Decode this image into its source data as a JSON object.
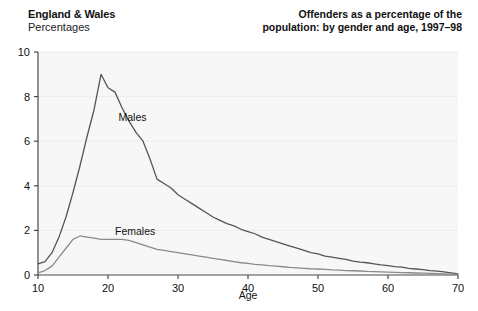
{
  "header": {
    "region": "England & Wales",
    "units": "Percentages",
    "title_line1": "Offenders as a percentage of the",
    "title_line2": "population: by gender and age, 1997–98"
  },
  "colors": {
    "plot_background": "#f7f7f7",
    "gridline": "#ececec",
    "axis": "#4a4a4a",
    "males_line": "#555555",
    "females_line": "#8a8a8a",
    "text": "#111111"
  },
  "chart_data": {
    "type": "line",
    "title": "Offenders as a percentage of the population: by gender and age, 1997–98",
    "subtitle": "England & Wales",
    "xlabel": "Age",
    "ylabel": "Percentages",
    "xlim": [
      10,
      70
    ],
    "ylim": [
      0,
      10
    ],
    "xticks": [
      10,
      20,
      30,
      40,
      50,
      60,
      70
    ],
    "yticks": [
      0,
      2,
      4,
      6,
      8,
      10
    ],
    "grid": true,
    "legend": "inline-labels",
    "x": [
      10,
      11,
      12,
      13,
      14,
      15,
      16,
      17,
      18,
      19,
      20,
      21,
      22,
      23,
      24,
      25,
      26,
      27,
      28,
      29,
      30,
      31,
      32,
      33,
      34,
      35,
      36,
      37,
      38,
      39,
      40,
      41,
      42,
      43,
      44,
      45,
      46,
      47,
      48,
      49,
      50,
      51,
      52,
      53,
      54,
      55,
      56,
      57,
      58,
      59,
      60,
      61,
      62,
      63,
      64,
      65,
      66,
      67,
      68,
      69,
      70
    ],
    "series": [
      {
        "name": "Males",
        "color": "#555555",
        "values": [
          0.5,
          0.6,
          1.0,
          1.7,
          2.6,
          3.7,
          4.9,
          6.2,
          7.4,
          9.0,
          8.4,
          8.2,
          7.5,
          6.9,
          6.4,
          6.0,
          5.2,
          4.3,
          4.1,
          3.9,
          3.6,
          3.4,
          3.2,
          3.0,
          2.8,
          2.6,
          2.45,
          2.3,
          2.2,
          2.05,
          1.95,
          1.85,
          1.7,
          1.6,
          1.5,
          1.4,
          1.3,
          1.2,
          1.1,
          1.0,
          0.95,
          0.85,
          0.8,
          0.75,
          0.7,
          0.62,
          0.58,
          0.55,
          0.5,
          0.45,
          0.42,
          0.38,
          0.35,
          0.3,
          0.27,
          0.24,
          0.2,
          0.17,
          0.14,
          0.1,
          0.05
        ]
      },
      {
        "name": "Females",
        "color": "#8a8a8a",
        "values": [
          0.1,
          0.2,
          0.4,
          0.8,
          1.2,
          1.6,
          1.75,
          1.7,
          1.65,
          1.6,
          1.6,
          1.6,
          1.6,
          1.55,
          1.45,
          1.35,
          1.25,
          1.15,
          1.1,
          1.05,
          1.0,
          0.95,
          0.9,
          0.85,
          0.8,
          0.75,
          0.7,
          0.65,
          0.6,
          0.55,
          0.52,
          0.48,
          0.45,
          0.42,
          0.4,
          0.37,
          0.34,
          0.32,
          0.3,
          0.28,
          0.27,
          0.25,
          0.23,
          0.22,
          0.2,
          0.19,
          0.18,
          0.16,
          0.15,
          0.14,
          0.13,
          0.12,
          0.11,
          0.1,
          0.09,
          0.08,
          0.07,
          0.06,
          0.05,
          0.04,
          0.03
        ]
      }
    ],
    "annotations": [
      {
        "text": "Males",
        "x": 21.5,
        "y": 6.9
      },
      {
        "text": "Females",
        "x": 21.0,
        "y": 1.8
      }
    ]
  }
}
